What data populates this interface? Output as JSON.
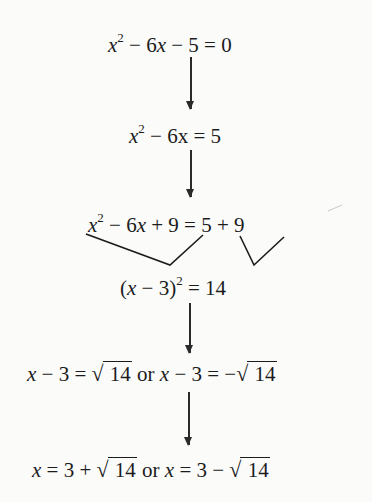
{
  "steps": [
    {
      "parts": [
        "x",
        "2",
        " − 6",
        "x",
        " − 5 = 0"
      ],
      "text": "x² − 6x − 5 = 0"
    },
    {
      "parts": [
        "x",
        "2",
        " − 6x = 5"
      ],
      "text": "x² − 6x = 5"
    },
    {
      "parts": [
        "x",
        "2",
        " − 6",
        "x",
        " + 9 = 5 + 9"
      ],
      "text": "x² − 6x + 9 = 5 + 9"
    },
    {
      "parts": [
        "(",
        "x",
        " − 3)",
        "2",
        " = 14"
      ],
      "text": "(x − 3)² = 14"
    },
    {
      "parts": [
        "x",
        " − 3 = ",
        "√",
        " 14",
        " or ",
        "x",
        " − 3 = −",
        "√",
        " 14"
      ],
      "text": "x − 3 = √14 or x − 3 = −√14"
    },
    {
      "parts": [
        "x",
        " = 3 + ",
        "√",
        " 14",
        " or ",
        "x",
        " = 3 − ",
        "√",
        " 14"
      ],
      "text": "x = 3 + √14 or x = 3 − √14"
    }
  ],
  "colors": {
    "background": "#fbfbfa",
    "ink": "#1c1c1c"
  }
}
